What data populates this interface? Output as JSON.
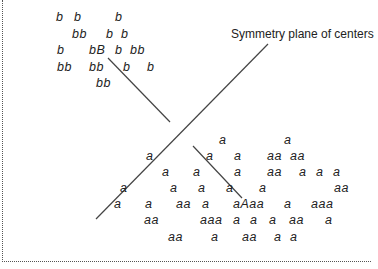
{
  "caption": {
    "text": "Symmetry plane of centers",
    "x": 231,
    "y": 27
  },
  "lines": [
    {
      "name": "symmetry-plane-line",
      "x1": 268,
      "y1": 44,
      "x2": 96,
      "y2": 219
    },
    {
      "name": "b-cluster-divider-line",
      "x1": 108,
      "y1": 58,
      "x2": 170,
      "y2": 122
    },
    {
      "name": "a-cluster-divider-line",
      "x1": 193,
      "y1": 146,
      "x2": 242,
      "y2": 198
    }
  ],
  "b_cluster": [
    {
      "t": "b",
      "x": 56,
      "y": 10
    },
    {
      "t": "b",
      "x": 74,
      "y": 10
    },
    {
      "t": "b",
      "x": 115,
      "y": 10
    },
    {
      "t": "bb",
      "x": 72,
      "y": 27
    },
    {
      "t": "b",
      "x": 106,
      "y": 27
    },
    {
      "t": "b",
      "x": 121,
      "y": 27
    },
    {
      "t": "b",
      "x": 57,
      "y": 43
    },
    {
      "t": "bB",
      "x": 89,
      "y": 43
    },
    {
      "t": "b",
      "x": 115,
      "y": 43
    },
    {
      "t": "bb",
      "x": 130,
      "y": 43
    },
    {
      "t": "bb",
      "x": 57,
      "y": 60
    },
    {
      "t": "bb",
      "x": 89,
      "y": 60
    },
    {
      "t": "b",
      "x": 123,
      "y": 60
    },
    {
      "t": "b",
      "x": 147,
      "y": 60
    },
    {
      "t": "bb",
      "x": 96,
      "y": 76
    }
  ],
  "a_cluster": [
    {
      "t": "a",
      "x": 219,
      "y": 133
    },
    {
      "t": "a",
      "x": 284,
      "y": 133
    },
    {
      "t": "a",
      "x": 146,
      "y": 149
    },
    {
      "t": "a",
      "x": 206,
      "y": 149
    },
    {
      "t": "a",
      "x": 234,
      "y": 149
    },
    {
      "t": "aa",
      "x": 267,
      "y": 149
    },
    {
      "t": "aa",
      "x": 290,
      "y": 149
    },
    {
      "t": "a",
      "x": 162,
      "y": 165
    },
    {
      "t": "a",
      "x": 193,
      "y": 165
    },
    {
      "t": "a",
      "x": 234,
      "y": 165
    },
    {
      "t": "aa",
      "x": 267,
      "y": 165
    },
    {
      "t": "a",
      "x": 299,
      "y": 165
    },
    {
      "t": "a",
      "x": 316,
      "y": 165
    },
    {
      "t": "a",
      "x": 333,
      "y": 165
    },
    {
      "t": "a",
      "x": 120,
      "y": 181
    },
    {
      "t": "a",
      "x": 170,
      "y": 181
    },
    {
      "t": "a",
      "x": 198,
      "y": 181
    },
    {
      "t": "a",
      "x": 226,
      "y": 181
    },
    {
      "t": "a",
      "x": 259,
      "y": 181
    },
    {
      "t": "aa",
      "x": 334,
      "y": 181
    },
    {
      "t": "a",
      "x": 114,
      "y": 197
    },
    {
      "t": "a",
      "x": 145,
      "y": 197
    },
    {
      "t": "aa",
      "x": 176,
      "y": 197
    },
    {
      "t": "a",
      "x": 202,
      "y": 197
    },
    {
      "t": "aAaa",
      "x": 233,
      "y": 197
    },
    {
      "t": "a",
      "x": 284,
      "y": 197
    },
    {
      "t": "aaa",
      "x": 311,
      "y": 197
    },
    {
      "t": "aa",
      "x": 144,
      "y": 213
    },
    {
      "t": "aaa",
      "x": 200,
      "y": 213
    },
    {
      "t": "a",
      "x": 233,
      "y": 213
    },
    {
      "t": "a",
      "x": 250,
      "y": 213
    },
    {
      "t": "a",
      "x": 269,
      "y": 213
    },
    {
      "t": "aa",
      "x": 289,
      "y": 213
    },
    {
      "t": "a",
      "x": 325,
      "y": 213
    },
    {
      "t": "aa",
      "x": 168,
      "y": 230
    },
    {
      "t": "a",
      "x": 211,
      "y": 230
    },
    {
      "t": "aa",
      "x": 242,
      "y": 230
    },
    {
      "t": "a",
      "x": 274,
      "y": 230
    },
    {
      "t": "a",
      "x": 290,
      "y": 230
    }
  ],
  "colors": {
    "ink": "#222222",
    "line": "#444444",
    "frame": "#555555",
    "background": "#ffffff"
  }
}
